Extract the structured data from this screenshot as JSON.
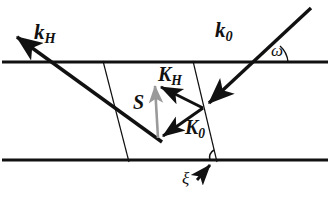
{
  "figure": {
    "background_color": "#ffffff",
    "line_color": "#111111",
    "gray_vector_color": "#9a9a9a",
    "width": 330,
    "height": 203
  },
  "labels": {
    "k_H": {
      "base": "k",
      "sub": "H"
    },
    "k_0": {
      "base": "k",
      "sub": "0"
    },
    "K_H": {
      "base": "K",
      "sub": "H"
    },
    "K_0": {
      "base": "K",
      "sub": "0"
    },
    "S": {
      "base": "S",
      "sub": ""
    },
    "omega": {
      "base": "ω",
      "sub": ""
    },
    "xi": {
      "base": "ξ",
      "sub": ""
    }
  },
  "geometry": {
    "surface_top_y": 62,
    "surface_bottom_y": 160,
    "lattice_plane_left": {
      "x1": 103,
      "y1": 62,
      "x2": 129,
      "y2": 161
    },
    "lattice_plane_right": {
      "x1": 193,
      "y1": 62,
      "x2": 217,
      "y2": 161
    },
    "incident_beam": {
      "x1": 311,
      "y1": 8,
      "x2": 203,
      "y2": 108
    },
    "diffracted_beam": {
      "x1": 160,
      "y1": 140,
      "x2": 13,
      "y2": 34
    },
    "vector_KH": {
      "x1": 203,
      "y1": 108,
      "x2": 156,
      "y2": 84
    },
    "vector_K0": {
      "x1": 203,
      "y1": 108,
      "x2": 159,
      "y2": 139
    },
    "vector_S": {
      "x1": 158,
      "y1": 138,
      "x2": 155,
      "y2": 82
    },
    "omega_arc_vertex": {
      "x": 265,
      "y": 62
    },
    "xi_arc_vertex": {
      "x": 216,
      "y": 160
    },
    "xi_pointer": {
      "x1": 198,
      "y1": 180,
      "x2": 213,
      "y2": 163
    }
  }
}
